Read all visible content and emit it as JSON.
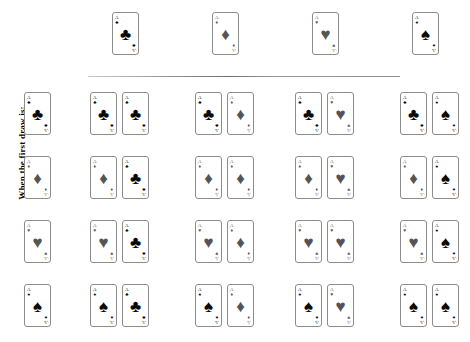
{
  "axis_label": "When the first draw is:",
  "rank": "A",
  "suits": {
    "clubs": {
      "name": "clubs",
      "glyph": "♣",
      "color": "#0a0a0a",
      "tone": "black"
    },
    "diamonds": {
      "name": "diamonds",
      "glyph": "♦",
      "color": "#555555",
      "tone": "gray"
    },
    "hearts": {
      "name": "hearts",
      "glyph": "♥",
      "color": "#555555",
      "tone": "gray"
    },
    "spades": {
      "name": "spades",
      "glyph": "♠",
      "color": "#0a0a0a",
      "tone": "black"
    }
  },
  "header": {
    "cards": [
      {
        "rank": "A",
        "suit": "clubs"
      },
      {
        "rank": "A",
        "suit": "diamonds"
      },
      {
        "rank": "A",
        "suit": "hearts"
      },
      {
        "rank": "A",
        "suit": "spades"
      }
    ]
  },
  "matrix": {
    "rows": [
      {
        "label_card": {
          "rank": "A",
          "suit": "clubs"
        },
        "pairs": [
          {
            "first": "clubs",
            "second": "clubs"
          },
          {
            "first": "clubs",
            "second": "diamonds"
          },
          {
            "first": "clubs",
            "second": "hearts"
          },
          {
            "first": "clubs",
            "second": "spades"
          }
        ]
      },
      {
        "label_card": {
          "rank": "A",
          "suit": "diamonds"
        },
        "pairs": [
          {
            "first": "diamonds",
            "second": "clubs"
          },
          {
            "first": "diamonds",
            "second": "diamonds"
          },
          {
            "first": "diamonds",
            "second": "hearts"
          },
          {
            "first": "diamonds",
            "second": "spades"
          }
        ]
      },
      {
        "label_card": {
          "rank": "A",
          "suit": "hearts"
        },
        "pairs": [
          {
            "first": "hearts",
            "second": "clubs"
          },
          {
            "first": "hearts",
            "second": "diamonds"
          },
          {
            "first": "hearts",
            "second": "hearts"
          },
          {
            "first": "hearts",
            "second": "spades"
          }
        ]
      },
      {
        "label_card": {
          "rank": "A",
          "suit": "spades"
        },
        "pairs": [
          {
            "first": "spades",
            "second": "clubs"
          },
          {
            "first": "spades",
            "second": "diamonds"
          },
          {
            "first": "spades",
            "second": "hearts"
          },
          {
            "first": "spades",
            "second": "spades"
          }
        ]
      }
    ]
  },
  "layout": {
    "header_card_x": [
      112,
      212,
      312,
      412
    ],
    "label_card_x": 24,
    "pair_group_x": [
      90,
      195,
      295,
      400
    ],
    "pair_inner_offset": 32,
    "row_y": [
      92,
      156,
      220,
      284
    ],
    "header_y": 12
  }
}
